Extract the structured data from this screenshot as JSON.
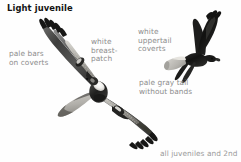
{
  "page": {
    "title": "Light juvenile",
    "background_color": "#fefefe",
    "title_color": "#141414",
    "label_color": "#8d8d8d",
    "caption_color": "#9a9a9a"
  },
  "labels": {
    "pale_bars": "pale bars\non coverts",
    "breast_patch": "white\nbreast-\npatch",
    "uppertail_coverts": "white\nuppertail\ncoverts",
    "pale_tail": "pale gray tail\nwithout bands"
  },
  "caption": {
    "text": "all juveniles and 2nd"
  },
  "figures": {
    "soaring_bird": {
      "name": "light-juvenile-hawk-underside",
      "orientation": "ventral-soaring-diagonal"
    },
    "flying_bird": {
      "name": "light-juvenile-hawk-upperside",
      "orientation": "dorsal-flight-profile"
    }
  }
}
